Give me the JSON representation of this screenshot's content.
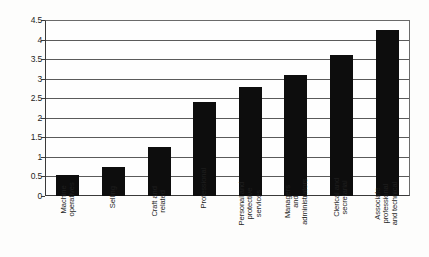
{
  "chart_data": {
    "type": "bar",
    "title": "",
    "subtitle": "",
    "xlabel": "",
    "ylabel": "",
    "ylim": [
      0,
      4.5
    ],
    "y_ticks": [
      "0",
      "0.5",
      "1",
      "1.5",
      "2",
      "2.5",
      "3",
      "3.5",
      "4",
      "4.5"
    ],
    "y_tick_values": [
      0,
      0.5,
      1,
      1.5,
      2,
      2.5,
      3,
      3.5,
      4,
      4.5
    ],
    "grid": true,
    "legend": null,
    "legend_position": "none",
    "orientation": "vertical",
    "bar_color": "#0d0d0d",
    "categories": [
      "Machine operatives",
      "Selling",
      "Craft and related",
      "Professional",
      "Personal and protective services",
      "Managers and administrators",
      "Clerical and secretarial",
      "Associate professional and technical"
    ],
    "category_lines": [
      [
        "Machine",
        "operatives"
      ],
      [
        "Selling"
      ],
      [
        "Craft and",
        "related"
      ],
      [
        "Professional"
      ],
      [
        "Personal and",
        "protective",
        "services"
      ],
      [
        "Managers",
        "and",
        "administrators"
      ],
      [
        "Clerical and",
        "secretarial"
      ],
      [
        "Associate",
        "professional",
        "and technical"
      ]
    ],
    "values": [
      0.55,
      0.75,
      1.25,
      2.4,
      2.8,
      3.1,
      3.6,
      4.25
    ]
  },
  "colors": {
    "bar": "#0d0d0d",
    "gridline": "#5a5a5a",
    "axis": "#3a3a3a",
    "background": "#fdfdfc",
    "text": "#1d1d1d"
  }
}
